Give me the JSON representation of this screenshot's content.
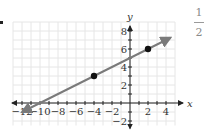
{
  "fraction": {
    "numerator": "1",
    "denominator": "2"
  },
  "chart_data": {
    "type": "line",
    "title": "",
    "xlabel": "x",
    "ylabel": "y",
    "xlim": [
      -13,
      5
    ],
    "ylim": [
      -2.5,
      9
    ],
    "grid": true,
    "x_ticks": [
      -12,
      -10,
      -8,
      -6,
      -4,
      -2,
      2,
      4
    ],
    "y_ticks": [
      -2,
      2,
      4,
      6,
      8
    ],
    "x_tick_labels": [
      "−12",
      "−10",
      "−8",
      "−6",
      "−4",
      "−2",
      "2",
      "4"
    ],
    "y_tick_labels": [
      "−2",
      "2",
      "4",
      "6",
      "8"
    ],
    "line": {
      "equation": "y = (1/2)x + 5",
      "slope": 0.5,
      "intercept": 5,
      "x_from": -12,
      "x_to": 4.5,
      "arrows": "both"
    },
    "points": [
      {
        "x": -4,
        "y": 3
      },
      {
        "x": 2,
        "y": 6
      }
    ],
    "colors": {
      "line": "#7a7a7a",
      "axis": "#222222",
      "grid": "#e6e6e6",
      "point": "#111111"
    }
  }
}
